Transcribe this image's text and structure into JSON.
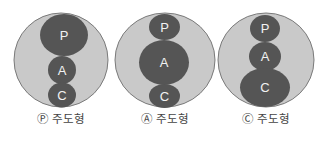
{
  "diagrams": [
    {
      "label": "Ⓟ 주도형",
      "outer": {
        "cx": 61,
        "cy": 60,
        "rx": 47,
        "ry": 47
      },
      "parts": [
        {
          "letter": "P",
          "cx": 64,
          "cy": 35,
          "rx": 24,
          "ry": 21
        },
        {
          "letter": "A",
          "cx": 62,
          "cy": 70,
          "rx": 14,
          "ry": 14
        },
        {
          "letter": "C",
          "cx": 62,
          "cy": 95,
          "rx": 14,
          "ry": 12.5
        }
      ]
    },
    {
      "label": "Ⓐ 주도형",
      "outer": {
        "cx": 165,
        "cy": 60,
        "rx": 50,
        "ry": 47
      },
      "parts": [
        {
          "letter": "P",
          "cx": 164.5,
          "cy": 27,
          "rx": 15.5,
          "ry": 13
        },
        {
          "letter": "A",
          "cx": 164,
          "cy": 62.5,
          "rx": 25,
          "ry": 22.5
        },
        {
          "letter": "C",
          "cx": 164.5,
          "cy": 96,
          "rx": 15.5,
          "ry": 12
        }
      ]
    },
    {
      "label": "Ⓒ 주도형",
      "outer": {
        "cx": 266,
        "cy": 60,
        "rx": 48,
        "ry": 47
      },
      "parts": [
        {
          "letter": "P",
          "cx": 265,
          "cy": 28.5,
          "rx": 15,
          "ry": 13.5
        },
        {
          "letter": "A",
          "cx": 265,
          "cy": 56.5,
          "rx": 16,
          "ry": 14.5
        },
        {
          "letter": "C",
          "cx": 265,
          "cy": 87.5,
          "rx": 25,
          "ry": 19.5
        }
      ]
    }
  ],
  "colors": {
    "outer_fill": "#c9c9c9",
    "outer_stroke": "#7a7a7a",
    "inner_fill": "#555555",
    "inner_text": "#f2f2f2",
    "label_text": "#444444"
  }
}
